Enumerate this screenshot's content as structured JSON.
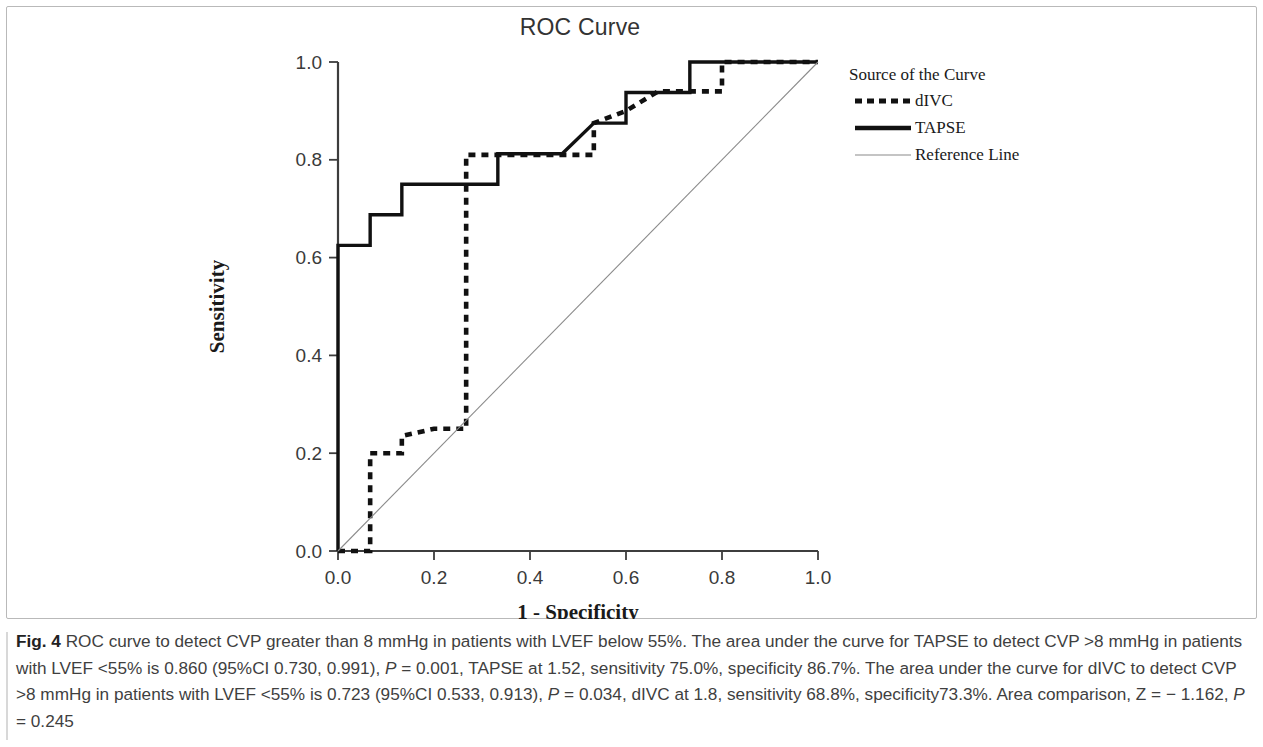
{
  "figure": {
    "title": "ROC Curve",
    "caption_number": "Fig. 4",
    "caption_text_1": " ROC curve to detect CVP greater than 8 mmHg in patients with LVEF below 55%. The area under the curve for TAPSE to detect CVP >8 mmHg in patients with LVEF <55% is 0.860 (95%CI 0.730, 0.991), ",
    "caption_p1": "P",
    "caption_text_2": " = 0.001, TAPSE at 1.52, sensitivity 75.0%, specificity 86.7%. The area under the curve for dIVC to detect CVP >8 mmHg in patients with LVEF <55% is 0.723 (95%CI 0.533, 0.913), ",
    "caption_p2": "P",
    "caption_text_3": " = 0.034, dIVC at 1.8, sensitivity 68.8%, specificity73.3%. Area comparison, Z = − 1.162, ",
    "caption_p3": "P",
    "caption_text_4": " = 0.245"
  },
  "chart_data": {
    "type": "line",
    "title": "ROC Curve",
    "xlabel": "1 - Specificity",
    "ylabel": "Sensitivity",
    "xlim": [
      0,
      1
    ],
    "ylim": [
      0,
      1
    ],
    "xticks": [
      "0.0",
      "0.2",
      "0.4",
      "0.6",
      "0.8",
      "1.0"
    ],
    "yticks": [
      "0.0",
      "0.2",
      "0.4",
      "0.6",
      "0.8",
      "1.0"
    ],
    "xtick_values": [
      0.0,
      0.2,
      0.4,
      0.6,
      0.8,
      1.0
    ],
    "ytick_values": [
      0.0,
      0.2,
      0.4,
      0.6,
      0.8,
      1.0
    ],
    "grid": false,
    "legend_position": "right",
    "legend_title": "Source of the Curve",
    "series": [
      {
        "name": "dIVC",
        "style": "dashed",
        "color": "#111111",
        "points": [
          [
            0.0,
            0.0
          ],
          [
            0.067,
            0.0
          ],
          [
            0.067,
            0.2
          ],
          [
            0.133,
            0.2
          ],
          [
            0.133,
            0.235
          ],
          [
            0.2,
            0.25
          ],
          [
            0.267,
            0.25
          ],
          [
            0.267,
            0.5
          ],
          [
            0.267,
            0.81
          ],
          [
            0.333,
            0.81
          ],
          [
            0.4,
            0.81
          ],
          [
            0.533,
            0.81
          ],
          [
            0.533,
            0.875
          ],
          [
            0.6,
            0.9
          ],
          [
            0.667,
            0.94
          ],
          [
            0.733,
            0.94
          ],
          [
            0.8,
            0.94
          ],
          [
            0.8,
            1.0
          ],
          [
            1.0,
            1.0
          ]
        ]
      },
      {
        "name": "TAPSE",
        "style": "solid",
        "color": "#111111",
        "points": [
          [
            0.0,
            0.0
          ],
          [
            0.0,
            0.625
          ],
          [
            0.067,
            0.625
          ],
          [
            0.067,
            0.6875
          ],
          [
            0.133,
            0.6875
          ],
          [
            0.133,
            0.75
          ],
          [
            0.267,
            0.75
          ],
          [
            0.267,
            0.75
          ],
          [
            0.333,
            0.75
          ],
          [
            0.333,
            0.8125
          ],
          [
            0.4,
            0.8125
          ],
          [
            0.467,
            0.8125
          ],
          [
            0.533,
            0.875
          ],
          [
            0.6,
            0.875
          ],
          [
            0.6,
            0.9375
          ],
          [
            0.667,
            0.9375
          ],
          [
            0.733,
            0.9375
          ],
          [
            0.733,
            1.0
          ],
          [
            1.0,
            1.0
          ]
        ]
      },
      {
        "name": "Reference Line",
        "style": "thin",
        "color": "#8a8a8a",
        "points": [
          [
            0.0,
            0.0
          ],
          [
            1.0,
            1.0
          ]
        ]
      }
    ]
  }
}
